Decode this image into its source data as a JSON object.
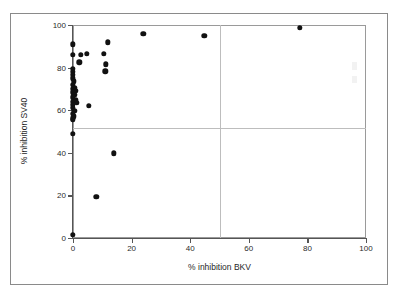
{
  "chart_data": {
    "type": "scatter",
    "title": "",
    "xlabel": "% inhibition BKV",
    "ylabel": "% inhibition SV40",
    "xlim": [
      0,
      100
    ],
    "ylim": [
      0,
      100
    ],
    "xticks": [
      0,
      20,
      40,
      60,
      80,
      100
    ],
    "yticks": [
      0,
      20,
      40,
      60,
      80,
      100
    ],
    "xtick_labels": [
      "0",
      "20",
      "40",
      "60",
      "80",
      "100"
    ],
    "ytick_labels": [
      "0",
      "20",
      "40",
      "60",
      "80",
      "100"
    ],
    "grid": false,
    "legend": null,
    "legend_position": "none",
    "marker": "filled-circle",
    "marker_color": "#111111",
    "frame_color": "#9a9a9a",
    "reference_lines": [
      {
        "orientation": "vertical",
        "value": 50,
        "color": "#bdbdbd"
      },
      {
        "orientation": "horizontal",
        "value": 51.5,
        "color": "#bdbdbd"
      }
    ],
    "points": [
      {
        "x": 0.0,
        "y": 91.0
      },
      {
        "x": 0.0,
        "y": 86.0
      },
      {
        "x": 2.2,
        "y": 82.5
      },
      {
        "x": 4.8,
        "y": 86.5
      },
      {
        "x": 2.6,
        "y": 86.0
      },
      {
        "x": 10.5,
        "y": 86.5
      },
      {
        "x": 11.8,
        "y": 91.8
      },
      {
        "x": 11.2,
        "y": 81.5
      },
      {
        "x": 11.0,
        "y": 78.2
      },
      {
        "x": 24.0,
        "y": 95.8
      },
      {
        "x": 44.8,
        "y": 95.0
      },
      {
        "x": 77.5,
        "y": 98.8
      },
      {
        "x": 0.0,
        "y": 79.5
      },
      {
        "x": 0.0,
        "y": 78.0
      },
      {
        "x": 0.0,
        "y": 76.5
      },
      {
        "x": 0.0,
        "y": 75.0
      },
      {
        "x": 0.3,
        "y": 73.5
      },
      {
        "x": 0.0,
        "y": 72.0
      },
      {
        "x": 0.6,
        "y": 70.5
      },
      {
        "x": 0.0,
        "y": 70.0
      },
      {
        "x": 0.8,
        "y": 69.2
      },
      {
        "x": 0.0,
        "y": 68.4
      },
      {
        "x": 0.4,
        "y": 67.2
      },
      {
        "x": 0.0,
        "y": 66.0
      },
      {
        "x": 0.9,
        "y": 64.6
      },
      {
        "x": 0.0,
        "y": 64.0
      },
      {
        "x": 1.3,
        "y": 63.4
      },
      {
        "x": 0.0,
        "y": 62.6
      },
      {
        "x": 5.4,
        "y": 62.2
      },
      {
        "x": 0.0,
        "y": 61.0
      },
      {
        "x": 0.5,
        "y": 59.6
      },
      {
        "x": 0.0,
        "y": 58.4
      },
      {
        "x": 0.2,
        "y": 57.2
      },
      {
        "x": 0.0,
        "y": 56.2
      },
      {
        "x": 0.0,
        "y": 55.4
      },
      {
        "x": 0.0,
        "y": 49.0
      },
      {
        "x": 14.0,
        "y": 39.8
      },
      {
        "x": 8.0,
        "y": 19.4
      },
      {
        "x": 0.0,
        "y": 1.5
      }
    ]
  }
}
